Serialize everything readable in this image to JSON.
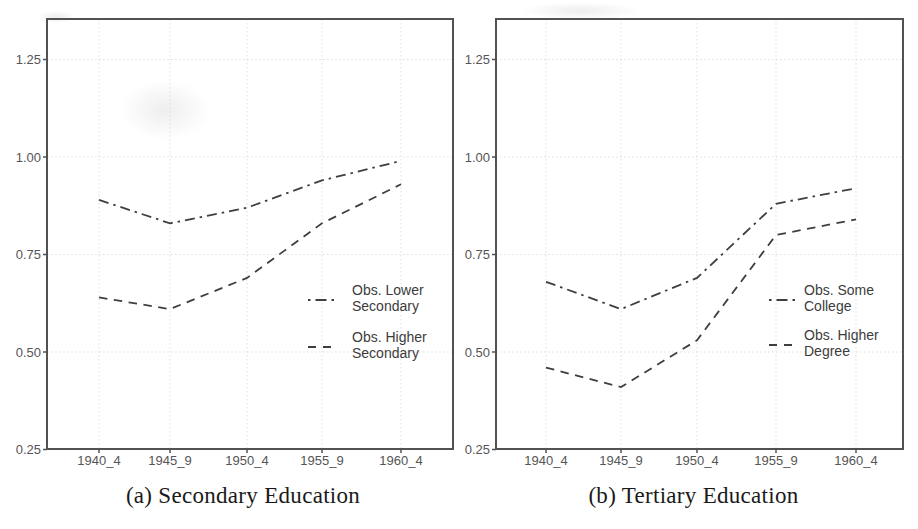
{
  "figure": {
    "background_color": "#ffffff",
    "line_color": "#3f3f3f",
    "frame_color": "#525252",
    "grid_color": "#dedede",
    "axis_text_color": "#555555",
    "legend_text_color": "#3c3c3c",
    "caption_color": "#1a1a1a"
  },
  "chart_data": [
    {
      "type": "line",
      "caption": "(a) Secondary Education",
      "title": "",
      "xlabel": "",
      "ylabel": "",
      "categories": [
        "1940_4",
        "1945_9",
        "1950_4",
        "1955_9",
        "1960_4"
      ],
      "series": [
        {
          "name": "Obs. Lower Secondary",
          "legend_lines": [
            "Obs. Lower",
            "Secondary"
          ],
          "style": "dashdot",
          "values": [
            0.89,
            0.83,
            0.87,
            0.94,
            0.99
          ]
        },
        {
          "name": "Obs. Higher Secondary",
          "legend_lines": [
            "Obs. Higher",
            "Secondary"
          ],
          "style": "dashed",
          "values": [
            0.64,
            0.61,
            0.69,
            0.83,
            0.93
          ]
        }
      ],
      "y_ticks": [
        0.25,
        0.5,
        0.75,
        1.0,
        1.25
      ],
      "y_tick_labels": [
        "0.25",
        "0.50",
        "0.75",
        "1.00",
        "1.25"
      ],
      "ylim": [
        0.25,
        1.36
      ],
      "grid": true,
      "legend_position": "inside-right"
    },
    {
      "type": "line",
      "caption": "(b) Tertiary Education",
      "title": "",
      "xlabel": "",
      "ylabel": "",
      "categories": [
        "1940_4",
        "1945_9",
        "1950_4",
        "1955_9",
        "1960_4"
      ],
      "series": [
        {
          "name": "Obs. Some College",
          "legend_lines": [
            "Obs. Some",
            "College"
          ],
          "style": "dashdot",
          "values": [
            0.68,
            0.61,
            0.69,
            0.88,
            0.92
          ]
        },
        {
          "name": "Obs. Higher Degree",
          "legend_lines": [
            "Obs. Higher",
            "Degree"
          ],
          "style": "dashed",
          "values": [
            0.46,
            0.41,
            0.53,
            0.8,
            0.84
          ]
        }
      ],
      "y_ticks": [
        0.25,
        0.5,
        0.75,
        1.0,
        1.25
      ],
      "y_tick_labels": [
        "0.25",
        "0.50",
        "0.75",
        "1.00",
        "1.25"
      ],
      "ylim": [
        0.25,
        1.36
      ],
      "grid": true,
      "legend_position": "inside-right"
    }
  ]
}
